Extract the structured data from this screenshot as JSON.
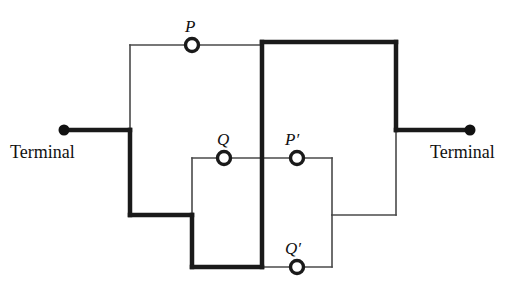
{
  "diagram": {
    "type": "electrical-schematic",
    "canvas": {
      "width": 520,
      "height": 288
    },
    "colors": {
      "background": "#ffffff",
      "wire": "#1a1a1a",
      "thin_wire": "#4a4a4a",
      "node_fill": "#ffffff",
      "terminal_dot": "#111111"
    },
    "stroke_widths": {
      "thick": 4.5,
      "thin": 1.6
    },
    "terminals": [
      {
        "name": "terminal-left",
        "label": "Terminal",
        "dot_x": 64,
        "dot_y": 130,
        "label_x": 10,
        "label_y": 143
      },
      {
        "name": "terminal-right",
        "label": "Terminal",
        "dot_x": 470,
        "dot_y": 130,
        "label_x": 430,
        "label_y": 143
      }
    ],
    "nodes": [
      {
        "name": "node-P",
        "label": "P",
        "cx": 192,
        "cy": 45,
        "r": 6.5,
        "label_x": 185,
        "label_y": 18
      },
      {
        "name": "node-Q",
        "label": "Q",
        "cx": 224,
        "cy": 158,
        "r": 6.5,
        "label_x": 217,
        "label_y": 131
      },
      {
        "name": "node-P-prime",
        "label": "P′",
        "cx": 297,
        "cy": 158,
        "r": 6.5,
        "label_x": 285,
        "label_y": 131
      },
      {
        "name": "node-Q-prime",
        "label": "Q′",
        "cx": 297,
        "cy": 267,
        "r": 6.5,
        "label_x": 285,
        "label_y": 240
      }
    ],
    "wires": {
      "thick": [
        {
          "name": "wire-left-terminal-lead",
          "points": "64,130 130,130"
        },
        {
          "name": "wire-left-down",
          "points": "130,130 130,215"
        },
        {
          "name": "wire-left-bottom-right",
          "points": "130,215 192,215"
        },
        {
          "name": "wire-inner-left-down",
          "points": "192,215 192,267"
        },
        {
          "name": "wire-inner-bottom",
          "points": "192,267 262,267"
        },
        {
          "name": "wire-center-vertical",
          "points": "262,267 262,42"
        },
        {
          "name": "wire-top-right",
          "points": "262,42 396,42"
        },
        {
          "name": "wire-right-down",
          "points": "396,42 396,130"
        },
        {
          "name": "wire-right-terminal-lead",
          "points": "396,130 470,130"
        }
      ],
      "thin": [
        {
          "name": "wire-outer-top-left-vertical",
          "points": "130,130 130,45"
        },
        {
          "name": "wire-outer-top",
          "points": "130,45 262,45"
        },
        {
          "name": "wire-inner-left-vertical",
          "points": "192,215 192,158"
        },
        {
          "name": "wire-inner-top",
          "points": "192,158 332,158"
        },
        {
          "name": "wire-inner-right-vertical",
          "points": "332,158 332,215"
        },
        {
          "name": "wire-inner-bottom-right",
          "points": "332,215 396,215"
        },
        {
          "name": "wire-right-lower-vertical",
          "points": "396,215 396,130"
        },
        {
          "name": "wire-lower-bottom",
          "points": "262,267 332,267"
        },
        {
          "name": "wire-lower-right-vertical",
          "points": "332,267 332,215"
        }
      ]
    }
  }
}
